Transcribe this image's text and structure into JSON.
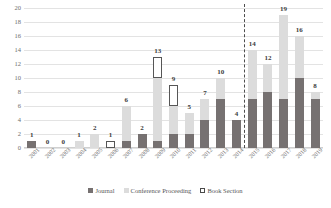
{
  "chart_data": {
    "type": "bar",
    "stacked": true,
    "title": "",
    "subtitle": "",
    "xlabel": "",
    "ylabel": "",
    "ylim": [
      0,
      20
    ],
    "ytick_step": 2,
    "yticks": [
      "0",
      "2",
      "4",
      "6",
      "8",
      "10",
      "12",
      "14",
      "16",
      "18",
      "20"
    ],
    "grid": true,
    "legend_position": "bottom",
    "categories": [
      "2001",
      "2002",
      "2003",
      "2004",
      "2005",
      "2006",
      "2007",
      "2008",
      "2009",
      "2010",
      "2011",
      "2012",
      "2013",
      "2014",
      "2015",
      "2016",
      "2017",
      "2018",
      "2019"
    ],
    "series": [
      {
        "name": "Journal",
        "color": "#767171",
        "values": [
          1,
          0,
          0,
          0,
          0,
          0,
          1,
          2,
          1,
          2,
          2,
          4,
          7,
          4,
          7,
          8,
          7,
          10,
          7
        ]
      },
      {
        "name": "Conference Proceeding",
        "color": "#dcdcdc",
        "values": [
          0,
          0,
          0,
          1,
          2,
          0,
          5,
          0,
          9,
          4,
          3,
          3,
          3,
          0,
          7,
          4,
          12,
          6,
          1
        ]
      },
      {
        "name": "Book Section",
        "color": "#ffffff",
        "values": [
          0,
          0,
          0,
          0,
          0,
          1,
          0,
          0,
          3,
          3,
          0,
          0,
          0,
          0,
          0,
          0,
          0,
          0,
          0
        ]
      }
    ],
    "totals": [
      1,
      0,
      0,
      1,
      2,
      1,
      6,
      2,
      13,
      9,
      5,
      7,
      10,
      4,
      14,
      12,
      19,
      16,
      8
    ],
    "annotations": [
      {
        "type": "vertical-dashed-line",
        "after_category": "2014",
        "color": "#4d4d4d"
      }
    ]
  },
  "legend": {
    "items": [
      {
        "label": "Journal",
        "swatch": "journal-swatch"
      },
      {
        "label": "Conference Proceeding",
        "swatch": "conference-swatch"
      },
      {
        "label": "Book Section",
        "swatch": "book-section-swatch"
      }
    ]
  }
}
